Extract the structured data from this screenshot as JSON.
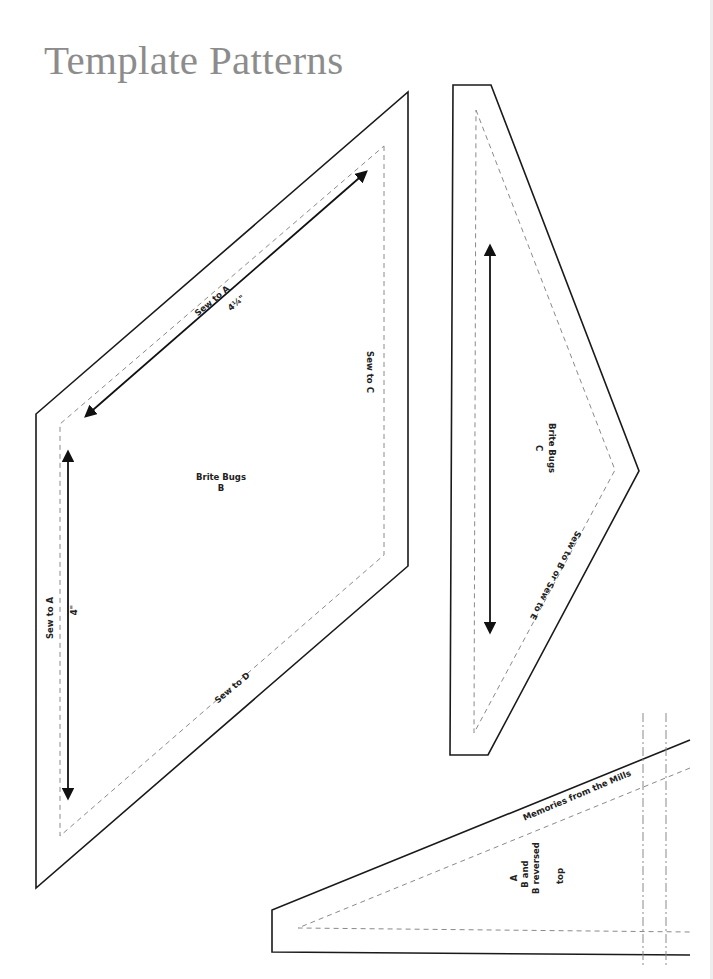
{
  "page": {
    "title": "Template Patterns"
  },
  "templates": [
    {
      "id": "B",
      "name": "Brite Bugs",
      "letter": "B",
      "edges": {
        "top": "Sew to A",
        "right": "Sew to C",
        "left": "Sew to A",
        "bottom": "Sew to D"
      },
      "measurements": {
        "diagonal": "4¼\"",
        "vertical": "4\""
      }
    },
    {
      "id": "C",
      "name": "Brite Bugs",
      "letter": "C",
      "edges": {
        "lower": "Sew to B or Sew to E"
      }
    },
    {
      "id": "A",
      "name": "Memories from the Mills",
      "lines": [
        "A",
        "B and",
        "B reversed"
      ],
      "note": "top"
    }
  ],
  "colors": {
    "title": "#8c8c8c",
    "cut_line": "#1a1a1a",
    "seam_line": "#8a8a8a"
  }
}
